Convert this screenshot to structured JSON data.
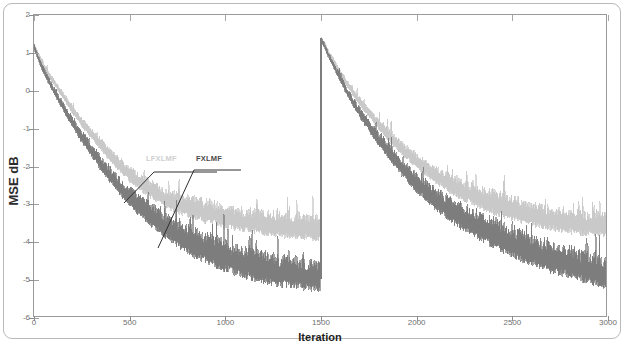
{
  "figure": {
    "kind": "scanned-figure",
    "background": "#ffffff",
    "frame_color": "#b9b9b9",
    "axis_color": "#9a9a9a"
  },
  "axis": {
    "x_label": "Iteration",
    "y_label": "MSE dB",
    "x_ticks": [
      "0",
      "500",
      "1000",
      "1500",
      "2000",
      "2500",
      "3000"
    ],
    "y_ticks": [
      "2",
      "1",
      "0",
      "-1",
      "-2",
      "-3",
      "-4",
      "-5",
      "-6"
    ]
  },
  "annotations": [
    {
      "name": "lfxlmf-callout",
      "label": "LFXLMF",
      "color": "#cfcfcf"
    },
    {
      "name": "fxlmf-callout",
      "label": "FXLMF",
      "color": "#4a4a4a"
    }
  ],
  "chart_data": {
    "type": "line",
    "title": "",
    "subtitle": "",
    "xlabel": "Iteration",
    "ylabel": "MSE dB",
    "xlim": [
      0,
      3000
    ],
    "ylim": [
      -6,
      2
    ],
    "xticks": [
      0,
      500,
      1000,
      1500,
      2000,
      2500,
      3000
    ],
    "yticks": [
      2,
      1,
      0,
      -1,
      -2,
      -3,
      -4,
      -5,
      -6
    ],
    "grid": false,
    "legend_position": "inline-callout-annotations",
    "reset_iteration": 1500,
    "reset_peak_db": 1.4,
    "noise_amplitude_db": {
      "LFXLMF": 0.35,
      "FXLMF": 0.45
    },
    "series": [
      {
        "name": "LFXLMF",
        "color": "#c9c9c9",
        "x": [
          0,
          40,
          80,
          120,
          160,
          200,
          250,
          300,
          350,
          400,
          450,
          500,
          600,
          700,
          800,
          900,
          1000,
          1100,
          1200,
          1300,
          1400,
          1499,
          1500,
          1540,
          1580,
          1620,
          1660,
          1700,
          1750,
          1800,
          1850,
          1900,
          1950,
          2000,
          2100,
          2200,
          2300,
          2400,
          2500,
          2600,
          2700,
          2800,
          2900,
          3000
        ],
        "values": [
          1.2,
          0.75,
          0.4,
          0.1,
          -0.2,
          -0.5,
          -0.85,
          -1.15,
          -1.45,
          -1.75,
          -2.0,
          -2.25,
          -2.62,
          -2.92,
          -3.1,
          -3.25,
          -3.38,
          -3.48,
          -3.55,
          -3.62,
          -3.68,
          -3.7,
          1.4,
          1.0,
          0.65,
          0.3,
          0.0,
          -0.28,
          -0.6,
          -0.9,
          -1.18,
          -1.45,
          -1.68,
          -1.9,
          -2.28,
          -2.58,
          -2.82,
          -3.02,
          -3.18,
          -3.32,
          -3.44,
          -3.52,
          -3.58,
          -3.62
        ]
      },
      {
        "name": "FXLMF",
        "color": "#7d7d7d",
        "x": [
          0,
          40,
          80,
          120,
          160,
          200,
          250,
          300,
          350,
          400,
          450,
          500,
          600,
          700,
          800,
          900,
          1000,
          1100,
          1200,
          1300,
          1400,
          1499,
          1500,
          1540,
          1580,
          1620,
          1660,
          1700,
          1750,
          1800,
          1850,
          1900,
          1950,
          2000,
          2100,
          2200,
          2300,
          2400,
          2500,
          2600,
          2700,
          2800,
          2900,
          3000
        ],
        "values": [
          1.15,
          0.62,
          0.22,
          -0.15,
          -0.5,
          -0.85,
          -1.25,
          -1.6,
          -1.95,
          -2.28,
          -2.58,
          -2.85,
          -3.3,
          -3.68,
          -4.0,
          -4.25,
          -4.45,
          -4.62,
          -4.75,
          -4.85,
          -4.92,
          -4.98,
          1.38,
          0.92,
          0.52,
          0.12,
          -0.25,
          -0.58,
          -0.95,
          -1.3,
          -1.62,
          -1.95,
          -2.22,
          -2.48,
          -2.92,
          -3.28,
          -3.58,
          -3.85,
          -4.08,
          -4.28,
          -4.48,
          -4.62,
          -4.78,
          -4.9
        ]
      }
    ]
  }
}
